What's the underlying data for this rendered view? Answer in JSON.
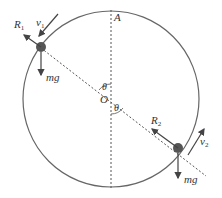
{
  "diagram": {
    "labels": {
      "top_point": "A",
      "center": "O",
      "angle_upper": "θ",
      "angle_lower": "θ",
      "R1": "R",
      "R1_sub": "1",
      "v1": "v",
      "v1_sub": "1",
      "mg1": "mg",
      "R2": "R",
      "R2_sub": "2",
      "v2": "v",
      "v2_sub": "2",
      "mg2": "mg"
    },
    "colors": {
      "stroke": "#555555",
      "particle": "#555555",
      "text": "#333333"
    }
  }
}
